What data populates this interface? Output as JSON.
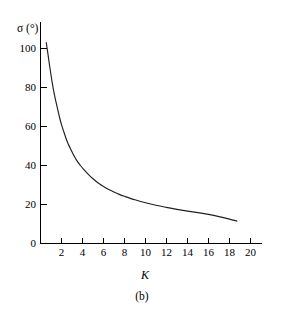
{
  "figure": {
    "caption": "(b)",
    "background_color": "#ffffff",
    "line_color": "#231f20"
  },
  "chart_data": {
    "type": "line",
    "title": "",
    "subtitle": "",
    "xlabel": "K",
    "ylabel": "σ (°)",
    "xlim": [
      0,
      21.0
    ],
    "ylim": [
      0,
      110
    ],
    "grid": false,
    "legend": null,
    "x_ticks": [
      2,
      4,
      6,
      8,
      10,
      12,
      14,
      16,
      18,
      20
    ],
    "x_tick_labels": [
      "2",
      "4",
      "6",
      "8",
      "10",
      "12",
      "14",
      "16",
      "18",
      "20"
    ],
    "y_ticks": [
      0,
      20,
      40,
      60,
      80,
      100
    ],
    "y_tick_labels": [
      "0",
      "20",
      "40",
      "60",
      "80",
      "100"
    ],
    "origin_label": "0",
    "annotations": [],
    "series": [
      {
        "name": "sigma-vs-K",
        "relation": "sigma ≈ 210 / K",
        "x": [
          0.55,
          0.7,
          0.9,
          1.1,
          1.3,
          1.5,
          1.8,
          2.0,
          2.3,
          2.6,
          3.0,
          3.4,
          3.8,
          4.2,
          4.6,
          5.0,
          5.5,
          6.0,
          6.5,
          7.0,
          7.5,
          8.0,
          9.0,
          10.0,
          11.0,
          12.0,
          13.0,
          14.0,
          15.0,
          16.0,
          17.0,
          18.0,
          18.7
        ],
        "y": [
          103.0,
          97.5,
          90.0,
          83.0,
          77.0,
          72.0,
          65.0,
          61.0,
          56.0,
          51.5,
          47.0,
          43.0,
          40.0,
          37.5,
          35.2,
          33.2,
          31.0,
          29.2,
          27.7,
          26.4,
          25.2,
          24.2,
          22.4,
          20.9,
          19.6,
          18.5,
          17.5,
          16.6,
          15.8,
          14.9,
          13.8,
          12.5,
          11.5
        ]
      }
    ]
  }
}
